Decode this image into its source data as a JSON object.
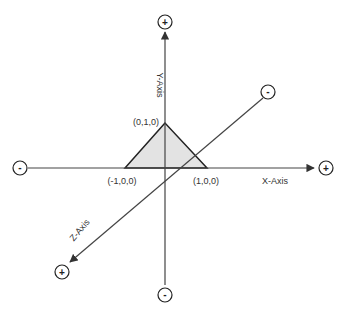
{
  "diagram": {
    "axes": {
      "x": {
        "label": "X-Axis",
        "positive_sign": "+",
        "negative_sign": "-"
      },
      "y": {
        "label": "Y-Axis",
        "positive_sign": "+",
        "negative_sign": "-"
      },
      "z": {
        "label": "Z-Axis",
        "positive_sign": "+",
        "negative_sign": "-"
      }
    },
    "triangle": {
      "vertices": [
        {
          "label": "(0,1,0)"
        },
        {
          "label": "(-1,0,0)"
        },
        {
          "label": "(1,0,0)"
        }
      ],
      "fill": "#e3e3e3",
      "stroke": "#222222"
    },
    "colors": {
      "axis": "#333333",
      "circle_stroke": "#222222"
    }
  }
}
